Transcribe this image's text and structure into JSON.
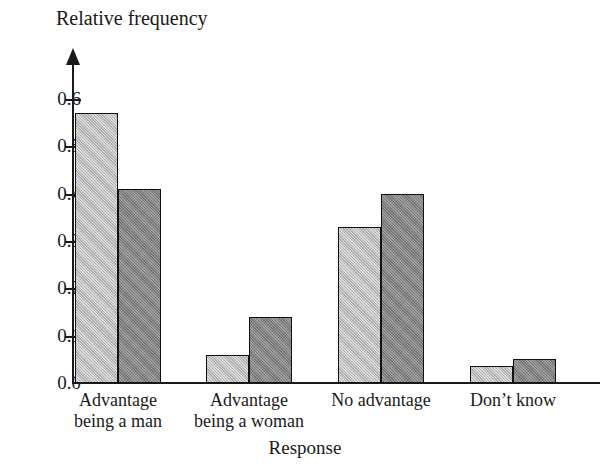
{
  "chart_data": {
    "type": "bar",
    "title": "",
    "ylabel": "Relative frequency",
    "xlabel": "Response",
    "categories": [
      "Advantage being a man",
      "Advantage being a woman",
      "No advantage",
      "Don’t know"
    ],
    "category_lines": [
      [
        "Advantage",
        "being a man"
      ],
      [
        "Advantage",
        "being a woman"
      ],
      [
        "No advantage",
        ""
      ],
      [
        "Don’t know",
        ""
      ]
    ],
    "series": [
      {
        "name": "series-a",
        "color": "#b4b4b4",
        "values": [
          0.57,
          0.06,
          0.33,
          0.035
        ]
      },
      {
        "name": "series-b",
        "color": "#7e7e7e",
        "values": [
          0.41,
          0.14,
          0.4,
          0.05
        ]
      }
    ],
    "ylim": [
      0.0,
      0.65
    ],
    "yticks": [
      0.0,
      0.1,
      0.2,
      0.3,
      0.4,
      0.5,
      0.6
    ],
    "ytick_labels": [
      "0.0",
      "0.1",
      "0.2",
      "0.3",
      "0.4",
      "0.5",
      "0.6"
    ],
    "grid": false,
    "legend": "none",
    "axis_color": "#1a1a1a",
    "bar_edge_color": "#111111",
    "background": "#ffffff"
  }
}
